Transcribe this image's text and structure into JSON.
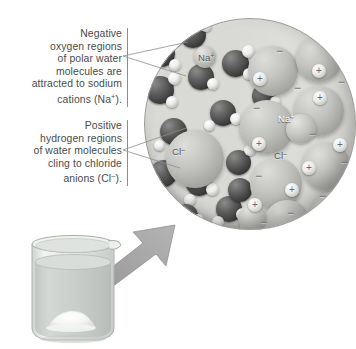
{
  "figure": {
    "background_color": "#ffffff"
  },
  "callouts": [
    {
      "id": "oxygen",
      "text": "Negative oxygen regions of polar water molecules are attracted to sodium cations (Na+).",
      "line1": "Negative",
      "line2": "oxygen regions",
      "line3": "of polar water",
      "line4": "molecules are",
      "line5": "attracted to sodium",
      "line6_pre": "cations (Na",
      "line6_sup": "+",
      "line6_post": ")."
    },
    {
      "id": "hydrogen",
      "text": "Positive hydrogen regions of water molecules cling to chloride anions (Cl-).",
      "line1": "Positive",
      "line2": "hydrogen regions",
      "line3": "of water molecules",
      "line4": "cling to chloride",
      "line5_pre": "anions (Cl",
      "line5_sup": "–",
      "line5_post": ")."
    }
  ],
  "magnifier": {
    "solution_labels": [
      {
        "id": "na-solution",
        "base": "Na",
        "sup": "+",
        "x": 198,
        "y": 57
      },
      {
        "id": "cl-solution",
        "base": "Cl",
        "sup": "–",
        "x": 174,
        "y": 150
      }
    ],
    "lattice_labels": [
      {
        "id": "na-lattice",
        "base": "Na",
        "sup": "+",
        "x": 279,
        "y": 120
      },
      {
        "id": "cl-lattice",
        "base": "Cl",
        "sup": "–",
        "x": 275,
        "y": 155
      }
    ],
    "charges": [
      {
        "sign": "−",
        "x": 279,
        "y": 51,
        "size": 0
      },
      {
        "sign": "+",
        "x": 318,
        "y": 70,
        "size": 13
      },
      {
        "sign": "−",
        "x": 341,
        "y": 82,
        "size": 0
      },
      {
        "sign": "+",
        "x": 258,
        "y": 78,
        "size": 13
      },
      {
        "sign": "−",
        "x": 297,
        "y": 88,
        "size": 0
      },
      {
        "sign": "+",
        "x": 318,
        "y": 96,
        "size": 13
      },
      {
        "sign": "−",
        "x": 256,
        "y": 108,
        "size": 0
      },
      {
        "sign": "−",
        "x": 312,
        "y": 134,
        "size": 0
      },
      {
        "sign": "+",
        "x": 257,
        "y": 142,
        "size": 13
      },
      {
        "sign": "+",
        "x": 338,
        "y": 143,
        "size": 13
      },
      {
        "sign": "−",
        "x": 344,
        "y": 162,
        "size": 0
      },
      {
        "sign": "+",
        "x": 307,
        "y": 166,
        "size": 13
      },
      {
        "sign": "−",
        "x": 258,
        "y": 176,
        "size": 0
      },
      {
        "sign": "+",
        "x": 290,
        "y": 188,
        "size": 13
      },
      {
        "sign": "+",
        "x": 253,
        "y": 203,
        "size": 13
      },
      {
        "sign": "−",
        "x": 290,
        "y": 213,
        "size": 0
      },
      {
        "sign": "−",
        "x": 263,
        "y": 222,
        "size": 0
      },
      {
        "sign": "−",
        "x": 322,
        "y": 196,
        "size": 0
      }
    ],
    "atom_legend": {
      "oxygen_color": "#3a3a3a",
      "hydrogen_color": "#ededed",
      "ion_color": "#c2c2bf",
      "background_color": "#d9d9d6"
    }
  },
  "beaker": {
    "contents": "water with undissolved salt",
    "water_color": "#c9cdc9",
    "glass_color": "#e4e7e4",
    "salt_color": "#fbfbfb"
  },
  "arrow": {
    "color": "#9d9d9d",
    "from": "salt pile in beaker",
    "to": "magnified circle"
  }
}
